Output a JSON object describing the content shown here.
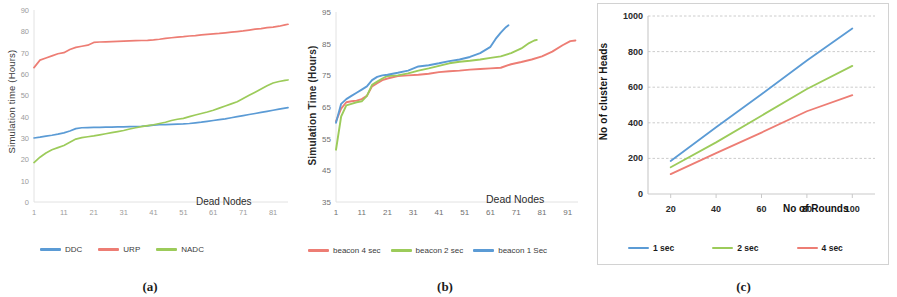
{
  "figure": {
    "panels": [
      {
        "caption": "(a)",
        "chart_data": {
          "type": "line",
          "title": "",
          "xlabel": "Dead Nodes",
          "ylabel": "Simulation time (Hours)",
          "xlim": [
            1,
            86
          ],
          "ylim": [
            0,
            90
          ],
          "xticks": [
            1,
            11,
            21,
            31,
            41,
            51,
            61,
            71,
            81
          ],
          "yticks": [
            0,
            10,
            20,
            30,
            40,
            50,
            60,
            70,
            80,
            90
          ],
          "grid": false,
          "legend_position": "bottom",
          "series": [
            {
              "name": "DDC",
              "color": "#5b9bd5",
              "x": [
                1,
                3,
                5,
                7,
                9,
                11,
                13,
                15,
                17,
                19,
                21,
                23,
                25,
                27,
                29,
                31,
                33,
                35,
                37,
                39,
                41,
                43,
                45,
                47,
                49,
                51,
                53,
                55,
                57,
                59,
                61,
                63,
                65,
                67,
                69,
                71,
                73,
                75,
                77,
                79,
                81,
                83,
                85,
                86
              ],
              "values": [
                30.0,
                30.4,
                30.9,
                31.3,
                31.8,
                32.4,
                33.3,
                34.4,
                34.8,
                34.9,
                35.0,
                35.0,
                35.1,
                35.1,
                35.2,
                35.2,
                35.3,
                35.4,
                35.5,
                35.7,
                36.0,
                36.2,
                36.3,
                36.4,
                36.5,
                36.6,
                36.8,
                37.1,
                37.4,
                37.8,
                38.2,
                38.6,
                39.0,
                39.5,
                40.0,
                40.5,
                41.0,
                41.5,
                42.0,
                42.5,
                43.0,
                43.5,
                44.0,
                44.2
              ]
            },
            {
              "name": "URP",
              "color": "#ed7d74",
              "x": [
                1,
                3,
                5,
                7,
                9,
                11,
                13,
                15,
                17,
                19,
                21,
                23,
                25,
                27,
                29,
                31,
                33,
                35,
                37,
                39,
                41,
                43,
                45,
                47,
                49,
                51,
                53,
                55,
                57,
                59,
                61,
                63,
                65,
                67,
                69,
                71,
                73,
                75,
                77,
                79,
                81,
                83,
                85,
                86
              ],
              "values": [
                63.0,
                66.5,
                67.5,
                68.5,
                69.5,
                70.0,
                71.5,
                72.5,
                73.0,
                73.5,
                74.8,
                75.0,
                75.1,
                75.2,
                75.3,
                75.4,
                75.5,
                75.6,
                75.7,
                75.8,
                76.0,
                76.3,
                76.7,
                77.0,
                77.3,
                77.5,
                77.8,
                78.0,
                78.3,
                78.6,
                78.8,
                79.0,
                79.3,
                79.6,
                79.9,
                80.2,
                80.6,
                81.0,
                81.3,
                81.7,
                82.0,
                82.4,
                83.0,
                83.3
              ]
            },
            {
              "name": "NADC",
              "color": "#9ccb5a",
              "x": [
                1,
                3,
                5,
                7,
                9,
                11,
                13,
                15,
                17,
                19,
                21,
                23,
                25,
                27,
                29,
                31,
                33,
                35,
                37,
                39,
                41,
                43,
                45,
                47,
                49,
                51,
                53,
                55,
                57,
                59,
                61,
                63,
                65,
                67,
                69,
                71,
                73,
                75,
                77,
                79,
                81,
                83,
                85,
                86
              ],
              "values": [
                18.5,
                21.0,
                23.0,
                24.5,
                25.5,
                26.5,
                28.0,
                29.5,
                30.2,
                30.6,
                31.0,
                31.5,
                32.0,
                32.5,
                33.0,
                33.5,
                34.2,
                34.8,
                35.3,
                35.8,
                36.2,
                36.8,
                37.4,
                38.2,
                38.8,
                39.2,
                40.0,
                40.8,
                41.5,
                42.2,
                43.0,
                44.0,
                45.0,
                46.0,
                47.0,
                48.5,
                50.0,
                51.5,
                53.0,
                54.5,
                55.8,
                56.5,
                57.0,
                57.2
              ]
            }
          ]
        }
      },
      {
        "caption": "(b)",
        "chart_data": {
          "type": "line",
          "title": "",
          "xlabel": "Dead Nodes",
          "ylabel": "Simulation Time (Hours)",
          "xlim": [
            1,
            95
          ],
          "ylim": [
            35,
            95
          ],
          "xticks": [
            1,
            11,
            21,
            31,
            41,
            51,
            61,
            71,
            81,
            91
          ],
          "yticks": [
            35,
            45,
            55,
            65,
            75,
            85,
            95
          ],
          "grid": false,
          "legend_position": "bottom",
          "series": [
            {
              "name": "beacon 4 sec",
              "color": "#ed7d74",
              "x": [
                1,
                3,
                5,
                7,
                9,
                11,
                13,
                15,
                17,
                19,
                21,
                25,
                29,
                33,
                37,
                41,
                45,
                49,
                53,
                57,
                61,
                65,
                69,
                73,
                77,
                81,
                85,
                89,
                92,
                94
              ],
              "values": [
                60.5,
                64.5,
                66.5,
                66.8,
                67.0,
                67.5,
                68.5,
                71.5,
                72.5,
                73.5,
                74.0,
                74.8,
                75.0,
                75.2,
                75.5,
                76.0,
                76.3,
                76.5,
                76.8,
                77.0,
                77.2,
                77.4,
                78.5,
                79.2,
                80.0,
                81.0,
                82.5,
                84.5,
                85.8,
                86.0
              ]
            },
            {
              "name": "beacon 2 sec",
              "color": "#9ccb5a",
              "x": [
                1,
                3,
                5,
                7,
                9,
                11,
                13,
                15,
                17,
                19,
                21,
                25,
                29,
                33,
                37,
                41,
                45,
                49,
                53,
                57,
                61,
                65,
                69,
                73,
                76,
                78,
                79
              ],
              "values": [
                51.5,
                62.0,
                65.5,
                66.0,
                66.5,
                66.8,
                68.5,
                72.0,
                73.0,
                74.0,
                74.8,
                75.0,
                75.6,
                76.5,
                77.2,
                78.0,
                78.8,
                79.3,
                79.6,
                80.0,
                80.5,
                81.0,
                82.0,
                83.5,
                85.2,
                86.0,
                86.2
              ]
            },
            {
              "name": "beacon 1 Sec",
              "color": "#5b9bd5",
              "x": [
                1,
                3,
                5,
                7,
                9,
                11,
                13,
                15,
                17,
                19,
                21,
                25,
                29,
                33,
                37,
                41,
                45,
                49,
                53,
                57,
                61,
                63,
                65,
                67,
                68
              ],
              "values": [
                60.0,
                66.0,
                67.5,
                68.5,
                69.5,
                70.5,
                71.5,
                73.5,
                74.5,
                75.0,
                75.2,
                75.8,
                76.5,
                77.8,
                78.2,
                78.8,
                79.5,
                80.0,
                80.8,
                82.0,
                84.0,
                86.5,
                88.5,
                90.2,
                90.8
              ]
            }
          ]
        }
      },
      {
        "caption": "(c)",
        "chart_data": {
          "type": "line",
          "title": "",
          "xlabel": "No of Rounds",
          "ylabel": "No of cluster Heads",
          "xlim": [
            10,
            110
          ],
          "ylim": [
            0,
            1000
          ],
          "xticks": [
            20,
            40,
            60,
            80,
            100
          ],
          "yticks": [
            0,
            200,
            400,
            600,
            800,
            1000
          ],
          "grid": true,
          "legend_position": "bottom",
          "series": [
            {
              "name": "1 sec",
              "color": "#5b9bd5",
              "x": [
                20,
                40,
                60,
                80,
                100
              ],
              "values": [
                185,
                375,
                560,
                750,
                930
              ]
            },
            {
              "name": "2 sec",
              "color": "#9ccb5a",
              "x": [
                20,
                40,
                60,
                80,
                100
              ],
              "values": [
                150,
                290,
                440,
                590,
                720
              ]
            },
            {
              "name": "4 sec",
              "color": "#ed7d74",
              "x": [
                20,
                40,
                60,
                80,
                100
              ],
              "values": [
                112,
                230,
                345,
                465,
                555
              ]
            }
          ]
        }
      }
    ]
  },
  "colors": {
    "blue": "#5b9bd5",
    "red": "#ed7d74",
    "green": "#9ccb5a",
    "gridline": "#bfbfbf",
    "axis": "#d9d9d9",
    "text": "#3a3a3a"
  }
}
